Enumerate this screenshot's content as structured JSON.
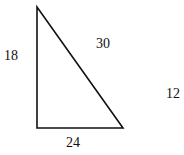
{
  "diagram": {
    "type": "right-triangle",
    "colors": {
      "stroke": "#111111",
      "background": "#ffffff",
      "text": "#111111"
    },
    "vertices": {
      "top": [
        37,
        7
      ],
      "right_angle": [
        37,
        128
      ],
      "bottom_right": [
        123,
        128
      ]
    },
    "labels": {
      "left_side": "18",
      "hypotenuse": "30",
      "bottom_side": "24",
      "detached": "12"
    }
  }
}
